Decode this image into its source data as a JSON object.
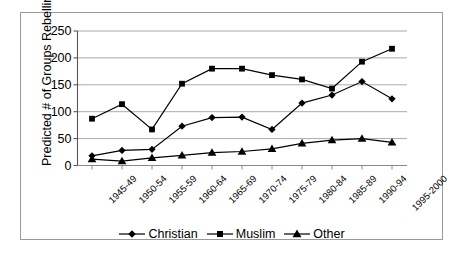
{
  "chart_data": {
    "type": "line",
    "title": "",
    "subtitle": "",
    "xlabel": "",
    "ylabel": "Predicted # of Groups Rebelling",
    "categories": [
      "1945-49",
      "1950-54",
      "1955-59",
      "1960-64",
      "1965-69",
      "1970-74",
      "1975-79",
      "1980-84",
      "1985-89",
      "1990-94",
      "1995-2000"
    ],
    "series": [
      {
        "name": "Christian",
        "marker": "diamond",
        "color": "#000000",
        "values": [
          18,
          28,
          30,
          73,
          89,
          90,
          67,
          116,
          131,
          156,
          124
        ]
      },
      {
        "name": "Muslim",
        "marker": "square",
        "color": "#000000",
        "values": [
          87,
          114,
          67,
          152,
          180,
          180,
          168,
          160,
          143,
          193,
          217
        ]
      },
      {
        "name": "Other",
        "marker": "triangle",
        "color": "#000000",
        "values": [
          12,
          8,
          14,
          19,
          24,
          26,
          31,
          41,
          47,
          50,
          43
        ]
      }
    ],
    "ylim": [
      0,
      250
    ],
    "yticks": [
      0,
      50,
      100,
      150,
      200,
      250
    ],
    "ytick_labels": [
      "0",
      "50",
      "100",
      "150",
      "200",
      "250"
    ],
    "grid": "horizontal",
    "legend_position": "bottom",
    "plot_background": "#ffffff",
    "grid_color": "#a0a0a0",
    "axis_color": "#6e6e6e"
  },
  "legend": {
    "entries": [
      {
        "label": "Christian",
        "marker": "diamond"
      },
      {
        "label": "Muslim",
        "marker": "square"
      },
      {
        "label": "Other",
        "marker": "triangle"
      }
    ]
  }
}
